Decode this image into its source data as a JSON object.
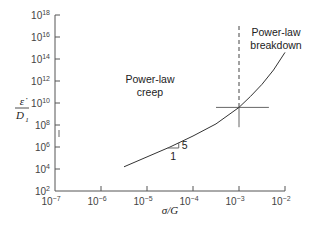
{
  "chart_data": {
    "type": "line",
    "title": "",
    "xlabel": "σ/G",
    "ylabel_numerator": "ε̇",
    "ylabel_denominator": "D",
    "ylabel_denominator_sub": "1",
    "xscale": "log",
    "yscale": "log",
    "xlim_exp": [
      -7,
      -2
    ],
    "ylim_exp": [
      2,
      18
    ],
    "x_ticks": [
      {
        "base": "10",
        "exp": "−7",
        "value_exp": -7
      },
      {
        "base": "10",
        "exp": "−6",
        "value_exp": -6
      },
      {
        "base": "10",
        "exp": "−5",
        "value_exp": -5
      },
      {
        "base": "10",
        "exp": "−4",
        "value_exp": -4
      },
      {
        "base": "10",
        "exp": "−3",
        "value_exp": -3
      },
      {
        "base": "10",
        "exp": "−2",
        "value_exp": -2
      }
    ],
    "y_ticks": [
      {
        "base": "10",
        "exp": "2",
        "value_exp": 2
      },
      {
        "base": "10",
        "exp": "4",
        "value_exp": 4
      },
      {
        "base": "10",
        "exp": "6",
        "value_exp": 6
      },
      {
        "base": "10",
        "exp": "8",
        "value_exp": 8
      },
      {
        "base": "10",
        "exp": "10",
        "value_exp": 10
      },
      {
        "base": "10",
        "exp": "12",
        "value_exp": 12
      },
      {
        "base": "10",
        "exp": "14",
        "value_exp": 14
      },
      {
        "base": "10",
        "exp": "16",
        "value_exp": 16
      },
      {
        "base": "10",
        "exp": "18",
        "value_exp": 18
      }
    ],
    "grid": false,
    "series": [
      {
        "name": "creep rate",
        "points_log10": [
          [
            -5.5,
            4.2
          ],
          [
            -5.0,
            5.1
          ],
          [
            -4.5,
            6.0
          ],
          [
            -4.0,
            7.0
          ],
          [
            -3.5,
            8.1
          ],
          [
            -3.0,
            9.6
          ],
          [
            -2.75,
            10.6
          ],
          [
            -2.5,
            11.7
          ],
          [
            -2.25,
            13.0
          ],
          [
            -2.0,
            14.6
          ]
        ]
      }
    ],
    "transition": {
      "x_exp": -3,
      "y_exp": 9.6
    },
    "crosshair": {
      "x_exp_range": [
        -3.5,
        -2.35
      ],
      "y_exp_range": [
        7.8,
        9.6
      ]
    },
    "dashed_boundary": {
      "x_exp": -3,
      "y_exp_range": [
        9.6,
        17.0
      ]
    },
    "slope_triangle": {
      "run_label": "1",
      "rise_label": "5"
    },
    "annotations": [
      {
        "id": "creep",
        "lines": [
          "Power-law",
          "creep"
        ]
      },
      {
        "id": "breakdown",
        "lines": [
          "Power-law",
          "breakdown"
        ]
      }
    ]
  }
}
